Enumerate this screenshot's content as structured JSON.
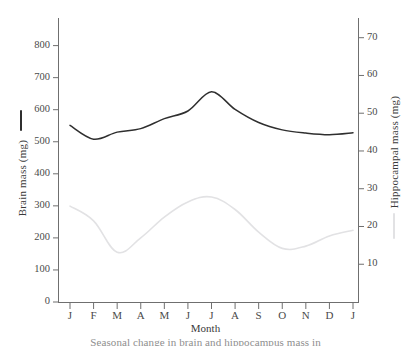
{
  "chart_data": {
    "type": "line",
    "title": "",
    "xlabel": "Month",
    "categories": [
      "J",
      "F",
      "M",
      "A",
      "M",
      "J",
      "J",
      "A",
      "S",
      "O",
      "N",
      "D",
      "J"
    ],
    "grid": false,
    "legend_position": "axis-labels",
    "axes": {
      "left": {
        "label": "Brain mass (mg)",
        "ticks": [
          0,
          100,
          200,
          300,
          400,
          500,
          600,
          700,
          800
        ],
        "ylim": [
          0,
          860
        ],
        "color": "#2f2f2f"
      },
      "right": {
        "label": "Hippocampal mass (mg)",
        "ticks": [
          10,
          20,
          30,
          40,
          50,
          60,
          70
        ],
        "ylim": [
          0,
          73
        ],
        "color": "#e2e2e4"
      }
    },
    "series": [
      {
        "name": "Brain mass (mg)",
        "axis": "left",
        "color": "#2f2f2f",
        "values": [
          551,
          508,
          530,
          541,
          572,
          596,
          656,
          601,
          560,
          537,
          527,
          522,
          528
        ]
      },
      {
        "name": "Hippocampal mass (mg)",
        "axis": "right",
        "color": "#e2e2e4",
        "values": [
          25.4,
          21.5,
          13.2,
          17.0,
          22.5,
          26.5,
          27.8,
          24.5,
          18.5,
          14.2,
          14.8,
          17.5,
          19.0
        ]
      }
    ]
  },
  "figure": {
    "caption_clipped": "Seasonal change in brain and hippocampus mass in",
    "legend_marker_left": "solid-dark-line",
    "legend_marker_right": "solid-light-line"
  }
}
